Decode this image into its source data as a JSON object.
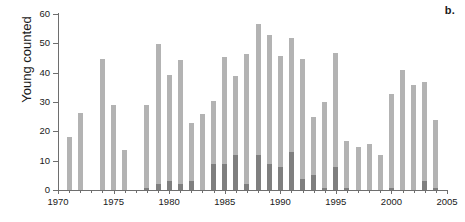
{
  "panel": {
    "label": "b."
  },
  "chart_data": {
    "type": "bar",
    "title": "",
    "subtitle": "",
    "xlabel": "",
    "ylabel": "Young counted",
    "xlim": [
      1970,
      2005
    ],
    "ylim": [
      0,
      60
    ],
    "grid": false,
    "legend_position": "none",
    "xticks": [
      1970,
      1975,
      1980,
      1985,
      1990,
      1995,
      2000,
      2005
    ],
    "xtick_labels": [
      "1970",
      "1975",
      "1980",
      "1985",
      "1990",
      "1995",
      "2000",
      "2005"
    ],
    "yticks": [
      0,
      10,
      20,
      30,
      40,
      50,
      60
    ],
    "ytick_labels": [
      "0",
      "10",
      "20",
      "30",
      "40",
      "50",
      "60"
    ],
    "colors": {
      "series_light": "#b3b3b3",
      "series_dark": "#7f7f7f",
      "axis": "#6e6e6e",
      "text": "#1a1a1a",
      "background": "#ffffff"
    },
    "x": [
      1971,
      1972,
      1974,
      1975,
      1976,
      1978,
      1979,
      1980,
      1981,
      1982,
      1983,
      1984,
      1985,
      1986,
      1987,
      1988,
      1989,
      1990,
      1991,
      1992,
      1993,
      1994,
      1995,
      1996,
      1997,
      1998,
      1999,
      2000,
      2001,
      2002,
      2003,
      2004
    ],
    "series": [
      {
        "name": "Young counted (total)",
        "color": "#b3b3b3",
        "values": [
          18.2,
          26.2,
          44.7,
          28.9,
          13.7,
          28.9,
          49.7,
          39.3,
          44.2,
          22.7,
          25.9,
          30.4,
          45.3,
          38.9,
          46.3,
          56.6,
          52.8,
          45.8,
          51.8,
          44.8,
          24.8,
          29.9,
          46.7,
          16.8,
          14.8,
          15.7,
          11.8,
          32.9,
          40.9,
          35.8,
          36.8,
          23.8
        ]
      },
      {
        "name": "Young counted (subset)",
        "color": "#7f7f7f",
        "values": [
          0,
          0,
          0,
          0,
          0,
          0.8,
          2.0,
          3.0,
          2.0,
          3.0,
          0,
          8.9,
          8.9,
          11.8,
          2.0,
          11.8,
          8.9,
          7.9,
          12.8,
          3.9,
          5.0,
          0.8,
          7.9,
          0.8,
          0,
          0,
          0,
          0.8,
          0,
          0,
          3.0,
          0.8
        ]
      }
    ]
  }
}
